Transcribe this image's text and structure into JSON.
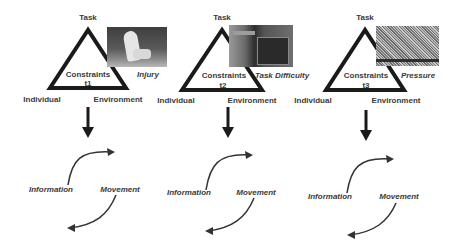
{
  "diagram": {
    "type": "constraints-led-approach",
    "stroke_color": "#1a1a1a",
    "text_color": "#3a3a3a",
    "panels": [
      {
        "id": "t1",
        "apex_label": "Task",
        "center_label": "Constraints",
        "time_label": "t1",
        "left_label": "Individual",
        "right_label": "Environment",
        "photo_icon": "injured-athlete-photo",
        "constraint_caption": "Injury",
        "cycle_left_label": "Information",
        "cycle_right_label": "Movement"
      },
      {
        "id": "t2",
        "apex_label": "Task",
        "center_label": "Constraints",
        "time_label": "t2",
        "left_label": "Individual",
        "right_label": "Environment",
        "photo_icon": "scoreboard-photo",
        "constraint_caption": "Task Difficulty",
        "cycle_left_label": "Information",
        "cycle_right_label": "Movement"
      },
      {
        "id": "t3",
        "apex_label": "Task",
        "center_label": "Constraints",
        "time_label": "t3",
        "left_label": "Individual",
        "right_label": "Environment",
        "photo_icon": "crowd-photo",
        "constraint_caption": "Pressure",
        "cycle_left_label": "Information",
        "cycle_right_label": "Movement"
      }
    ]
  }
}
